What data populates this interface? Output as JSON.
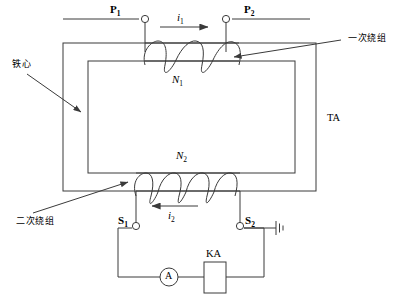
{
  "diagram": {
    "stroke_color": "#3a3a3a",
    "text_color": "#000000",
    "background": "#ffffff"
  },
  "labels": {
    "iron_core": "铁心",
    "primary_winding": "一次绕组",
    "secondary_winding": "二次绕组",
    "transformer_tag": "TA",
    "primary_terminal_left": "P",
    "primary_terminal_left_sub": "1",
    "primary_terminal_right": "P",
    "primary_terminal_right_sub": "2",
    "secondary_terminal_left": "S",
    "secondary_terminal_left_sub": "1",
    "secondary_terminal_right": "S",
    "secondary_terminal_right_sub": "2",
    "primary_turns": "N",
    "primary_turns_sub": "1",
    "secondary_turns": "N",
    "secondary_turns_sub": "2",
    "primary_current": "i",
    "primary_current_sub": "1",
    "secondary_current": "i",
    "secondary_current_sub": "2",
    "ammeter": "A",
    "relay": "KA"
  },
  "components": [
    {
      "name": "iron-core",
      "type": "rectangular-core",
      "label": "铁心"
    },
    {
      "name": "primary-winding",
      "type": "coil",
      "turns_drawn": 3,
      "label": "N1"
    },
    {
      "name": "secondary-winding",
      "type": "coil",
      "turns_drawn": 8,
      "label": "N2"
    },
    {
      "name": "ammeter",
      "type": "meter-circle",
      "label": "A"
    },
    {
      "name": "relay-ka",
      "type": "rectangle-coil",
      "label": "KA"
    },
    {
      "name": "earth-ground",
      "type": "ground-symbol",
      "label": ""
    }
  ],
  "currents": [
    {
      "name": "primary-current",
      "label": "i1",
      "direction": "right"
    },
    {
      "name": "secondary-current",
      "label": "i2",
      "direction": "left"
    }
  ]
}
